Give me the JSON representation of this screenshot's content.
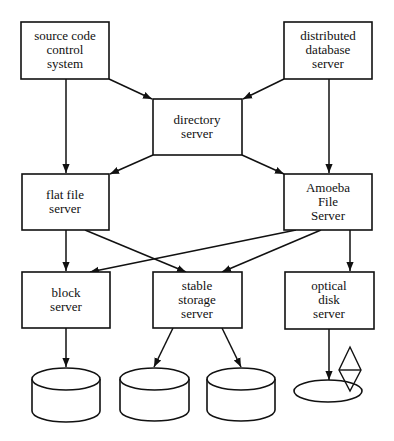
{
  "diagram": {
    "nodes": {
      "source_code": {
        "lines": [
          "source code",
          "control",
          "system"
        ]
      },
      "distributed_db": {
        "lines": [
          "distributed",
          "database",
          "server"
        ]
      },
      "directory": {
        "lines": [
          "directory",
          "server"
        ]
      },
      "flat_file": {
        "lines": [
          "flat file",
          "server"
        ]
      },
      "amoeba": {
        "lines": [
          "Amoeba",
          "File",
          "Server"
        ]
      },
      "block": {
        "lines": [
          "block",
          "server"
        ]
      },
      "stable_storage": {
        "lines": [
          "stable",
          "storage",
          "server"
        ]
      },
      "optical": {
        "lines": [
          "optical",
          "disk",
          "server"
        ]
      }
    },
    "edges": [
      [
        "source code control system",
        "flat file server"
      ],
      [
        "source code control system",
        "directory server"
      ],
      [
        "distributed database server",
        "directory server"
      ],
      [
        "distributed database server",
        "Amoeba File Server"
      ],
      [
        "directory server",
        "flat file server"
      ],
      [
        "directory server",
        "Amoeba File Server"
      ],
      [
        "flat file server",
        "block server"
      ],
      [
        "flat file server",
        "stable storage server"
      ],
      [
        "Amoeba File Server",
        "block server"
      ],
      [
        "Amoeba File Server",
        "stable storage server"
      ],
      [
        "Amoeba File Server",
        "optical disk server"
      ],
      [
        "block server",
        "disk"
      ],
      [
        "stable storage server",
        "disk"
      ],
      [
        "stable storage server",
        "disk"
      ],
      [
        "optical disk server",
        "optical disk"
      ]
    ]
  }
}
